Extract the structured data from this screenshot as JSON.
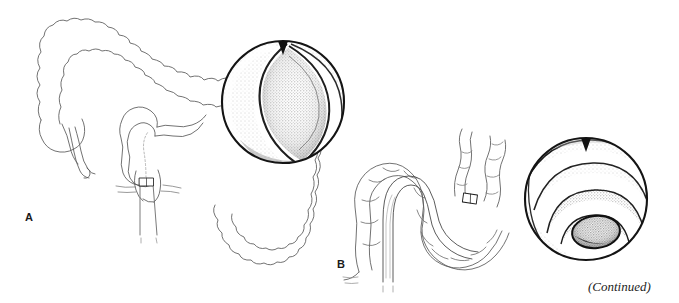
{
  "figure": {
    "domain": "medical-illustration",
    "background_color": "#ffffff",
    "ink_color": "#1a1a1a",
    "line_color": "#555555",
    "stipple_light": "#e8e8e8",
    "stipple_mid": "#c9c9c9",
    "stipple_dark": "#8f8f8f",
    "width": 679,
    "height": 303
  },
  "panels": [
    {
      "id": "A",
      "label": "A",
      "anatomy_caption": "Large intestine with colonoscope inserted through rectum into sigmoid colon",
      "parts": [
        "ascending colon",
        "transverse colon",
        "descending colon",
        "sigmoid colon",
        "cecum",
        "appendix",
        "rectum",
        "colonoscope shaft",
        "colonoscope tip"
      ],
      "endoscopic_view": {
        "caption": "Endoscopic view: slit-like sigmoid lumen seen as a vertical crescent",
        "shape": "crescent-lumen",
        "orientation_marker": "top-notch"
      }
    },
    {
      "id": "B",
      "label": "B",
      "anatomy_caption": "Sigmoid colon loop with colonoscope advanced around the bend",
      "parts": [
        "sigmoid loop",
        "descending colon",
        "haustra",
        "colonoscope shaft",
        "colonoscope tip"
      ],
      "endoscopic_view": {
        "caption": "Endoscopic view: concentric haustral folds receding toward distal lumen",
        "shape": "concentric-haustral-folds",
        "orientation_marker": "top-notch"
      }
    }
  ],
  "caption": {
    "continued_note": "(Continued)"
  }
}
